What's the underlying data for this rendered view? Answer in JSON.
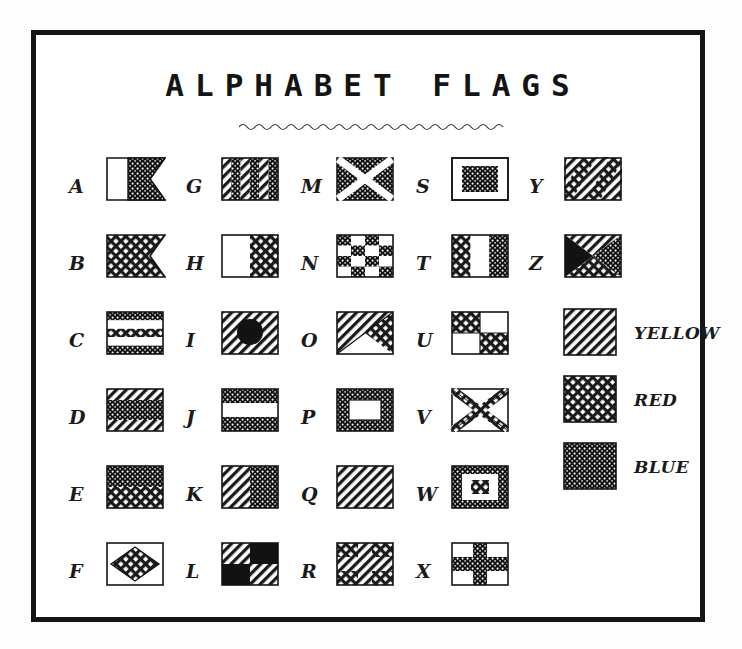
{
  "page": {
    "title": "ALPHABET FLAGS",
    "underline": "wavy-rule",
    "background": "#ffffff",
    "ink": "#151515"
  },
  "legend": {
    "items": [
      {
        "label": "YELLOW",
        "pattern": "diagonal-hatch",
        "color": "#1a1a1a"
      },
      {
        "label": "RED",
        "pattern": "cross-hatch",
        "color": "#1a1a1a"
      },
      {
        "label": "BLUE",
        "pattern": "stipple-dense",
        "color": "#1a1a1a"
      }
    ]
  },
  "columns": [
    {
      "letters": [
        "A",
        "B",
        "C",
        "D",
        "E",
        "F"
      ]
    },
    {
      "letters": [
        "G",
        "H",
        "I",
        "J",
        "K",
        "L"
      ]
    },
    {
      "letters": [
        "M",
        "N",
        "O",
        "P",
        "Q",
        "R"
      ]
    },
    {
      "letters": [
        "S",
        "T",
        "U",
        "V",
        "W",
        "X"
      ]
    },
    {
      "letters": [
        "Y",
        "Z"
      ]
    }
  ],
  "flags": [
    {
      "letter": "A",
      "shape": "swallowtail",
      "design": "vertical-half-white-blue"
    },
    {
      "letter": "B",
      "shape": "swallowtail",
      "design": "solid-red"
    },
    {
      "letter": "C",
      "shape": "rect",
      "design": "five-horizontal-bands-blue-white-red-white-blue"
    },
    {
      "letter": "D",
      "shape": "rect",
      "design": "three-horizontal-bands-yellow-blue-yellow"
    },
    {
      "letter": "E",
      "shape": "rect",
      "design": "two-horizontal-bands-blue-red"
    },
    {
      "letter": "F",
      "shape": "rect",
      "design": "white-with-red-diamond"
    },
    {
      "letter": "G",
      "shape": "rect",
      "design": "six-vertical-stripes-yellow-blue"
    },
    {
      "letter": "H",
      "shape": "rect",
      "design": "vertical-half-white-red"
    },
    {
      "letter": "I",
      "shape": "rect",
      "design": "yellow-with-black-circle"
    },
    {
      "letter": "J",
      "shape": "rect",
      "design": "three-horizontal-bands-blue-white-blue"
    },
    {
      "letter": "K",
      "shape": "rect",
      "design": "vertical-half-yellow-blue"
    },
    {
      "letter": "L",
      "shape": "rect",
      "design": "quartered-yellow-black"
    },
    {
      "letter": "M",
      "shape": "rect",
      "design": "blue-with-white-saltire"
    },
    {
      "letter": "N",
      "shape": "rect",
      "design": "checkerboard-blue-white"
    },
    {
      "letter": "O",
      "shape": "rect",
      "design": "diagonal-split-red-yellow"
    },
    {
      "letter": "P",
      "shape": "rect",
      "design": "blue-with-white-rectangle"
    },
    {
      "letter": "Q",
      "shape": "rect",
      "design": "solid-yellow"
    },
    {
      "letter": "R",
      "shape": "rect",
      "design": "red-with-yellow-cross"
    },
    {
      "letter": "S",
      "shape": "rect",
      "design": "white-with-blue-rectangle"
    },
    {
      "letter": "T",
      "shape": "rect",
      "design": "three-vertical-bands-red-white-blue"
    },
    {
      "letter": "U",
      "shape": "rect",
      "design": "quartered-red-white"
    },
    {
      "letter": "V",
      "shape": "rect",
      "design": "white-with-red-saltire"
    },
    {
      "letter": "W",
      "shape": "rect",
      "design": "concentric-blue-white-red"
    },
    {
      "letter": "X",
      "shape": "rect",
      "design": "white-with-blue-cross"
    },
    {
      "letter": "Y",
      "shape": "rect",
      "design": "diagonal-stripes-yellow-red"
    },
    {
      "letter": "Z",
      "shape": "rect",
      "design": "four-triangles-yellow-blue-black-red"
    }
  ]
}
